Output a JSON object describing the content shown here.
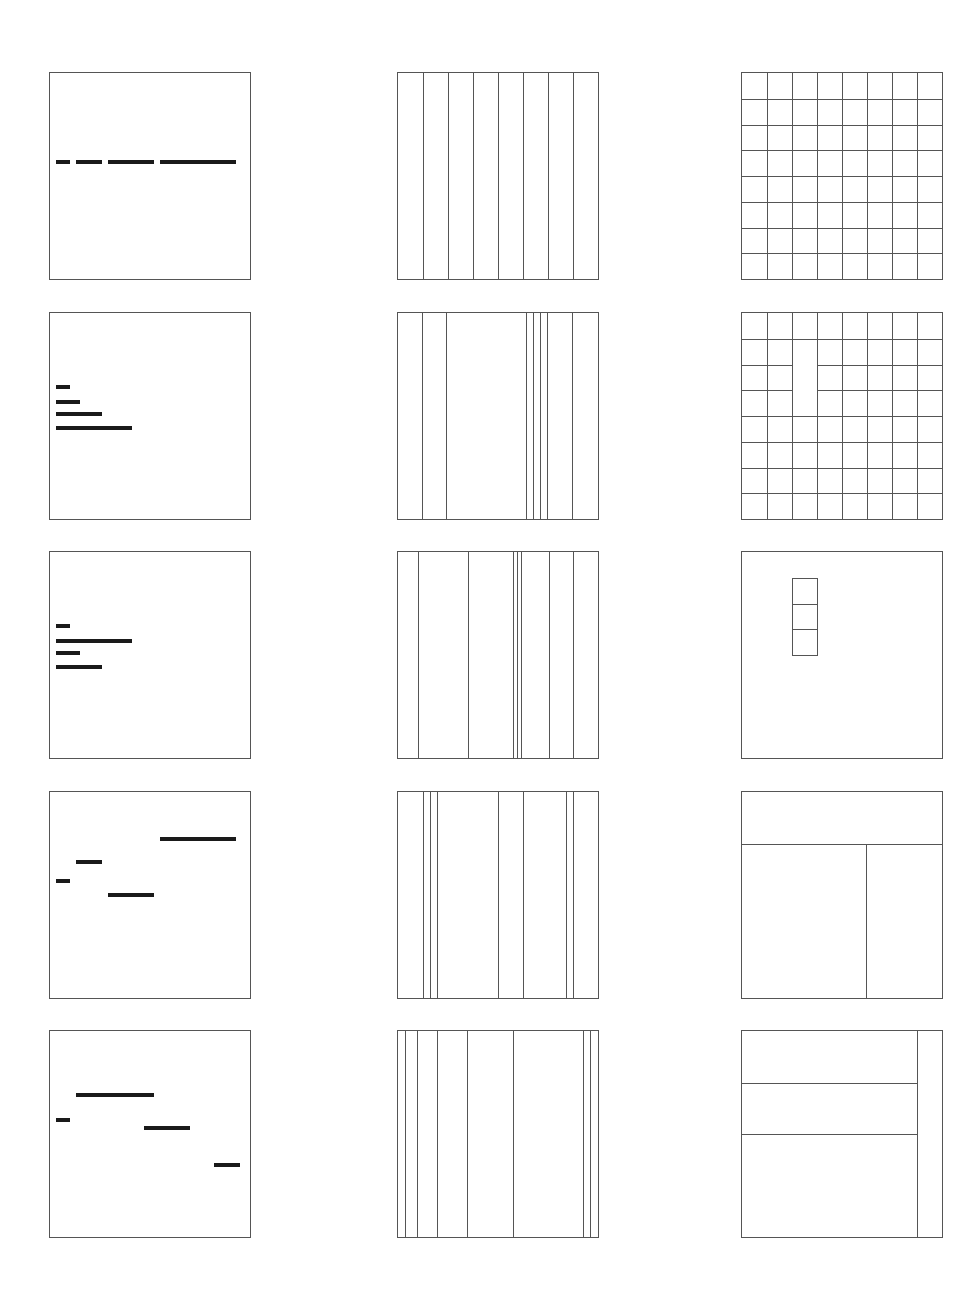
{
  "diagram": {
    "title": "",
    "grid": {
      "rows": 5,
      "columns": 3
    },
    "units_note": "Positions are expressed in panel-relative units (0-1) as the diagram depicts them.",
    "panels": [
      {
        "id": "r1c1",
        "type": "bars",
        "bars": [
          {
            "x0": 0.03,
            "x1": 0.1,
            "y": 0.43
          },
          {
            "x0": 0.13,
            "x1": 0.26,
            "y": 0.43
          },
          {
            "x0": 0.29,
            "x1": 0.52,
            "y": 0.43
          },
          {
            "x0": 0.55,
            "x1": 0.93,
            "y": 0.43
          }
        ]
      },
      {
        "id": "r1c2",
        "type": "columns",
        "lines": [
          0.125,
          0.25,
          0.375,
          0.5,
          0.625,
          0.75,
          0.875
        ]
      },
      {
        "id": "r1c3",
        "type": "grid",
        "rows": 8,
        "cols": 8,
        "merged": []
      },
      {
        "id": "r2c1",
        "type": "bars",
        "bars": [
          {
            "x0": 0.03,
            "x1": 0.1,
            "y": 0.36
          },
          {
            "x0": 0.03,
            "x1": 0.15,
            "y": 0.43
          },
          {
            "x0": 0.03,
            "x1": 0.26,
            "y": 0.49
          },
          {
            "x0": 0.03,
            "x1": 0.41,
            "y": 0.56
          }
        ]
      },
      {
        "id": "r2c2",
        "type": "columns",
        "lines": [
          0.12,
          0.24,
          0.64,
          0.675,
          0.71,
          0.745,
          0.87
        ]
      },
      {
        "id": "r2c3",
        "type": "grid",
        "rows": 8,
        "cols": 8,
        "merged": [
          {
            "col": 2,
            "row_start": 1,
            "row_end": 3
          }
        ]
      },
      {
        "id": "r3c1",
        "type": "bars",
        "bars": [
          {
            "x0": 0.03,
            "x1": 0.1,
            "y": 0.36
          },
          {
            "x0": 0.03,
            "x1": 0.41,
            "y": 0.43
          },
          {
            "x0": 0.03,
            "x1": 0.15,
            "y": 0.49
          },
          {
            "x0": 0.03,
            "x1": 0.26,
            "y": 0.56
          }
        ]
      },
      {
        "id": "r3c2",
        "type": "columns",
        "lines": [
          0.1,
          0.35,
          0.575,
          0.595,
          0.615,
          0.755,
          0.875
        ]
      },
      {
        "id": "r3c3",
        "type": "subgrid",
        "cells": [
          {
            "col": 2,
            "row": 1
          },
          {
            "col": 2,
            "row": 2
          },
          {
            "col": 2,
            "row": 3
          }
        ],
        "rows": 8,
        "cols": 8
      },
      {
        "id": "r4c1",
        "type": "bars",
        "bars": [
          {
            "x0": 0.55,
            "x1": 0.93,
            "y": 0.23
          },
          {
            "x0": 0.13,
            "x1": 0.26,
            "y": 0.34
          },
          {
            "x0": 0.03,
            "x1": 0.1,
            "y": 0.43
          },
          {
            "x0": 0.29,
            "x1": 0.52,
            "y": 0.5
          }
        ]
      },
      {
        "id": "r4c2",
        "type": "columns",
        "lines": [
          0.125,
          0.16,
          0.195,
          0.5,
          0.625,
          0.84,
          0.875
        ]
      },
      {
        "id": "r4c3",
        "type": "partition",
        "hlines": [
          {
            "y": 0.25,
            "x0": 0,
            "x1": 1
          }
        ],
        "vlines": [
          {
            "x": 0.62,
            "y0": 0.25,
            "y1": 1
          }
        ]
      },
      {
        "id": "r5c1",
        "type": "bars",
        "bars": [
          {
            "x0": 0.13,
            "x1": 0.52,
            "y": 0.31
          },
          {
            "x0": 0.03,
            "x1": 0.1,
            "y": 0.43
          },
          {
            "x0": 0.47,
            "x1": 0.7,
            "y": 0.47
          },
          {
            "x0": 0.82,
            "x1": 0.95,
            "y": 0.65
          }
        ]
      },
      {
        "id": "r5c2",
        "type": "columns",
        "lines": [
          0.035,
          0.095,
          0.195,
          0.345,
          0.575,
          0.925,
          0.96
        ]
      },
      {
        "id": "r5c3",
        "type": "partition",
        "hlines": [
          {
            "y": 0.25,
            "x0": 0,
            "x1": 0.875
          },
          {
            "y": 0.5,
            "x0": 0,
            "x1": 0.875
          }
        ],
        "vlines": [
          {
            "x": 0.875,
            "y0": 0,
            "y1": 1
          }
        ]
      }
    ]
  }
}
